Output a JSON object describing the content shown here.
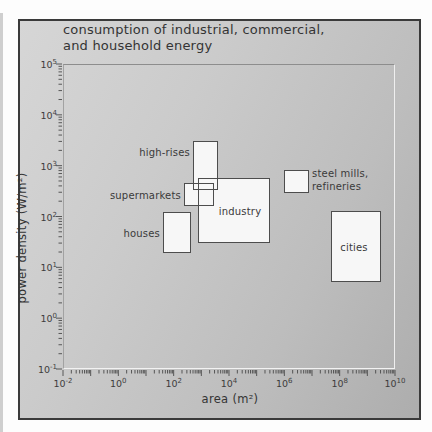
{
  "title": {
    "lines": [
      "consumption of industrial, commercial,",
      "and household energy"
    ]
  },
  "axes": {
    "x": {
      "label": "area (m²)",
      "ticks": [
        {
          "base": "10",
          "exp": "-2"
        },
        {
          "base": "10",
          "exp": "0"
        },
        {
          "base": "10",
          "exp": "2"
        },
        {
          "base": "10",
          "exp": "4"
        },
        {
          "base": "10",
          "exp": "6"
        },
        {
          "base": "10",
          "exp": "8"
        },
        {
          "base": "10",
          "exp": "10"
        }
      ]
    },
    "y": {
      "label": "power density (W/m²)",
      "ticks": [
        {
          "base": "10",
          "exp": "5"
        },
        {
          "base": "10",
          "exp": "4"
        },
        {
          "base": "10",
          "exp": "3"
        },
        {
          "base": "10",
          "exp": "2"
        },
        {
          "base": "10",
          "exp": "1"
        },
        {
          "base": "10",
          "exp": "0"
        },
        {
          "base": "10",
          "exp": "-1"
        }
      ]
    }
  },
  "chart_data": {
    "type": "scatter",
    "subtype": "labeled-range-boxes",
    "title": "consumption of industrial, commercial, and household energy",
    "xlabel": "area (m²)",
    "ylabel": "power density (W/m²)",
    "x_scale": "log",
    "y_scale": "log",
    "xlim": [
      0.01,
      10000000000.0
    ],
    "ylim": [
      0.1,
      100000
    ],
    "grid": false,
    "legend": false,
    "categories": [
      {
        "label": "high-rises",
        "area_m2": [
          500,
          4000
        ],
        "power_density_W_per_m2": [
          300,
          3000
        ],
        "label_position": "left-of-box"
      },
      {
        "label": "supermarkets",
        "area_m2": [
          200,
          3000
        ],
        "power_density_W_per_m2": [
          150,
          450
        ],
        "label_position": "left-of-box"
      },
      {
        "label": "industry",
        "area_m2": [
          800,
          300000
        ],
        "power_density_W_per_m2": [
          30,
          550
        ],
        "label_position": "inside-box"
      },
      {
        "label": "houses",
        "area_m2": [
          40,
          400
        ],
        "power_density_W_per_m2": [
          20,
          120
        ],
        "label_position": "left-of-box"
      },
      {
        "label": "steel mills, refineries",
        "label_lines": [
          "steel mills,",
          "refineries"
        ],
        "area_m2": [
          1000000,
          8000000
        ],
        "power_density_W_per_m2": [
          300,
          800
        ],
        "label_position": "right-of-box"
      },
      {
        "label": "cities",
        "area_m2": [
          50000000,
          3000000000
        ],
        "power_density_W_per_m2": [
          5,
          120
        ],
        "label_position": "inside-box"
      }
    ]
  },
  "colors": {
    "page_bg": "#fdfdfd",
    "panel_bg_light": "#d6d6d6",
    "panel_bg_dark": "#adadad",
    "panel_border": "#3a3a3a",
    "box_fill": "#f7f7f7",
    "box_border": "#4d4d4d",
    "text": "#343434",
    "tick": "#4a4a4a"
  }
}
